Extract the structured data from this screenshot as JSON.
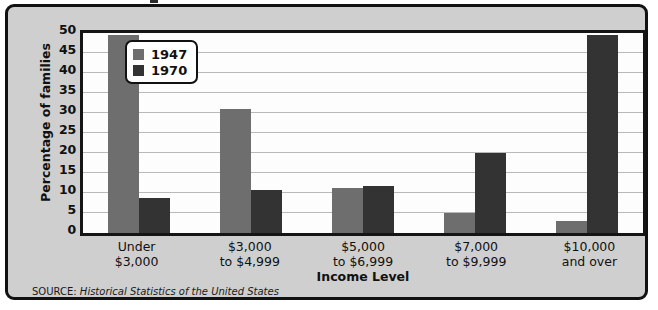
{
  "chart_data": {
    "type": "bar",
    "title": "",
    "xlabel": "Income Level",
    "ylabel": "Percentage of families",
    "categories": [
      "Under\n$3,000",
      "$3,000\nto $4,999",
      "$5,000\nto $6,999",
      "$7,000\nto $9,999",
      "$10,000\nand over"
    ],
    "category_lines": [
      [
        "Under",
        "$3,000"
      ],
      [
        "$3,000",
        "to $4,999"
      ],
      [
        "$5,000",
        "to $6,999"
      ],
      [
        "$7,000",
        "to $9,999"
      ],
      [
        "$10,000",
        "and over"
      ]
    ],
    "series": [
      {
        "name": "1947",
        "color": "#6e6e6e",
        "values": [
          49.5,
          31.0,
          11.3,
          5.0,
          3.0
        ]
      },
      {
        "name": "1970",
        "color": "#333333",
        "values": [
          8.8,
          10.7,
          11.8,
          20.0,
          49.5
        ]
      }
    ],
    "ylim": [
      0,
      50
    ],
    "yticks": [
      0,
      5,
      10,
      15,
      20,
      25,
      30,
      35,
      40,
      45,
      50
    ],
    "ytick_labels": [
      "0",
      "5",
      "10",
      "15",
      "20",
      "25",
      "30",
      "35",
      "40",
      "45",
      "50"
    ],
    "grid": true,
    "grid_axis": "y",
    "legend_position": "upper-left-inside"
  },
  "legend": {
    "entries": [
      {
        "label": "1947",
        "color": "#6e6e6e"
      },
      {
        "label": "1970",
        "color": "#333333"
      }
    ]
  },
  "source": {
    "label": "SOURCE:",
    "title": "Historical Statistics of the United States"
  },
  "colors": {
    "series_1947": "#6e6e6e",
    "series_1970": "#333333",
    "panel_background": "#fdfdfd",
    "figure_background": "#cfcfcf",
    "frame": "#111111",
    "gridline": "#b9b9b9"
  }
}
